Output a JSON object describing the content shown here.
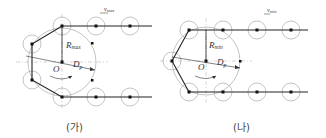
{
  "diagrams": [
    {
      "id": "ga",
      "caption": "(가)",
      "labels": {
        "velocity": "v",
        "velocity_sub": "max",
        "radius": "R",
        "radius_sub": "max",
        "center": "O",
        "diameter": "D",
        "diameter_sub": "p"
      }
    },
    {
      "id": "na",
      "caption": "(나)",
      "labels": {
        "velocity": "v",
        "velocity_sub": "min",
        "radius": "R",
        "radius_sub": "min",
        "center": "O",
        "diameter": "D",
        "diameter_sub": "p"
      }
    }
  ],
  "colors": {
    "line": "#222222",
    "circle": "#aaaaaa",
    "axis": "#bbbbbb",
    "dot": "#111111"
  }
}
